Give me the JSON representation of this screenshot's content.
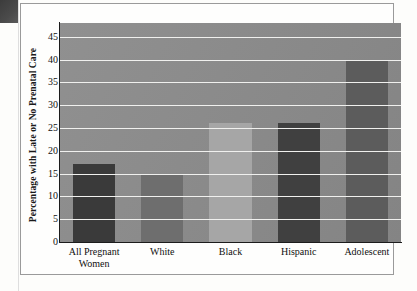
{
  "figure": {
    "background_color": "#fefefd",
    "border_color": "#9a9a9a"
  },
  "artifact": {
    "name": "scan-edge-artifact",
    "color": "#3c3c3c"
  },
  "axis": {
    "y_title": "Percentage with Late or No Prenatal Care",
    "y_ticks": [
      "0",
      "5",
      "10",
      "15",
      "20",
      "25",
      "30",
      "35",
      "40",
      "45"
    ],
    "x_labels": [
      "All Pregnant Women",
      "White",
      "Black",
      "Hispanic",
      "Adolescent"
    ]
  },
  "chart_data": {
    "type": "bar",
    "title": "",
    "xlabel": "",
    "ylabel": "Percentage with Late or No Prenatal Care",
    "categories": [
      "All Pregnant Women",
      "White",
      "Black",
      "Hispanic",
      "Adolescent"
    ],
    "values": [
      17,
      15,
      26,
      26,
      40
    ],
    "ylim": [
      0,
      48
    ],
    "ytick_values": [
      0,
      5,
      10,
      15,
      20,
      25,
      30,
      35,
      40,
      45
    ],
    "ytick_step": 5,
    "grid": true,
    "grid_color": "#f0f0ee",
    "legend": false,
    "plot_background": "#8a8a8a",
    "bar_colors": [
      "#3a3a3a",
      "#6e6e6e",
      "#a6a6a6",
      "#404040",
      "#5c5c5c"
    ],
    "bar_width_fraction": 0.62
  }
}
